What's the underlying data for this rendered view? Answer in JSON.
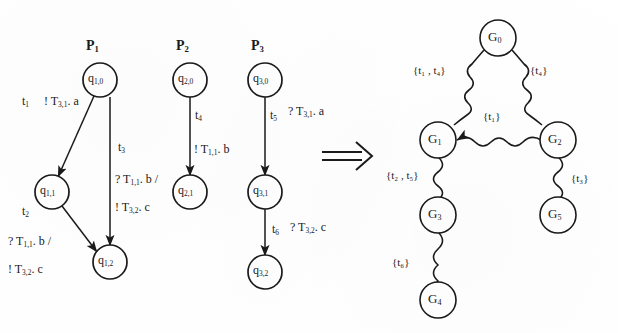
{
  "figure": {
    "implication_symbol": "⟹",
    "left_caption": "",
    "right_caption": ""
  },
  "processes": [
    {
      "name_base": "P",
      "name_sub": "1",
      "cx": 100,
      "states": [
        {
          "id": "p1q0",
          "base": "q",
          "sub": "1,0",
          "cx": 100,
          "cy": 80
        },
        {
          "id": "p1q1",
          "base": "q",
          "sub": "1,1",
          "cx": 52,
          "cy": 192
        },
        {
          "id": "p1q2",
          "base": "q",
          "sub": "1,2",
          "cx": 110,
          "cy": 262
        }
      ],
      "edges": [
        {
          "from": "p1q0",
          "to": "p1q1"
        },
        {
          "from": "p1q0",
          "to": "p1q2"
        },
        {
          "from": "p1q1",
          "to": "p1q2"
        }
      ]
    },
    {
      "name_base": "P",
      "name_sub": "2",
      "cx": 190,
      "states": [
        {
          "id": "p2q0",
          "base": "q",
          "sub": "2,0",
          "cx": 190,
          "cy": 80
        },
        {
          "id": "p2q1",
          "base": "q",
          "sub": "2,1",
          "cx": 190,
          "cy": 192
        }
      ],
      "edges": [
        {
          "from": "p2q0",
          "to": "p2q1"
        }
      ]
    },
    {
      "name_base": "P",
      "name_sub": "3",
      "cx": 265,
      "states": [
        {
          "id": "p3q0",
          "base": "q",
          "sub": "3,0",
          "cx": 265,
          "cy": 80
        },
        {
          "id": "p3q1",
          "base": "q",
          "sub": "3,1",
          "cx": 265,
          "cy": 192
        },
        {
          "id": "p3q2",
          "base": "q",
          "sub": "3,2",
          "cx": 265,
          "cy": 272
        }
      ],
      "edges": [
        {
          "from": "p3q0",
          "to": "p3q1"
        },
        {
          "from": "p3q1",
          "to": "p3q2"
        }
      ]
    }
  ],
  "transition_labels": {
    "t1_name": "t",
    "t1_sub": "1",
    "t1_action": "! T",
    "t1_action_sub": "3,1",
    "t1_action_tail": ". a",
    "t2_name": "t",
    "t2_sub": "2",
    "t2_action_line1": "? T",
    "t2_action_line1_sub": "1,1",
    "t2_action_line1_tail": ". b /",
    "t2_action_line2": "! T",
    "t2_action_line2_sub": "3,2",
    "t2_action_line2_tail": ". c",
    "t3_name": "t",
    "t3_sub": "3",
    "t3_action_line1": "? T",
    "t3_action_line1_sub": "1,1",
    "t3_action_line1_tail": ". b /",
    "t3_action_line2": "! T",
    "t3_action_line2_sub": "3,2",
    "t3_action_line2_tail": ". c",
    "t4_name": "t",
    "t4_sub": "4",
    "t4_action": "! T",
    "t4_action_sub": "1,1",
    "t4_action_tail": ". b",
    "t5_name": "t",
    "t5_sub": "5",
    "t5_action": "? T",
    "t5_action_sub": "3,1",
    "t5_action_tail": ". a",
    "t6_name": "t",
    "t6_sub": "6",
    "t6_action": "? T",
    "t6_action_sub": "3,2",
    "t6_action_tail": ". c"
  },
  "graph": {
    "nodes": [
      {
        "id": "G0",
        "base": "G",
        "sub": "0",
        "cx": 498,
        "cy": 38
      },
      {
        "id": "G1",
        "base": "G",
        "sub": "1",
        "cx": 438,
        "cy": 140
      },
      {
        "id": "G2",
        "base": "G",
        "sub": "2",
        "cx": 558,
        "cy": 140
      },
      {
        "id": "G3",
        "base": "G",
        "sub": "3",
        "cx": 438,
        "cy": 215
      },
      {
        "id": "G4",
        "base": "G",
        "sub": "4",
        "cx": 438,
        "cy": 300
      },
      {
        "id": "G5",
        "base": "G",
        "sub": "5",
        "cx": 558,
        "cy": 215
      }
    ],
    "edges": [
      {
        "id": "e_g0_g1",
        "from": "G0",
        "to": "G1",
        "label_open": "{",
        "label_items": "t₁ , t₄",
        "label_close": "}",
        "lx": 417,
        "ly": 70
      },
      {
        "id": "e_g0_g2",
        "from": "G0",
        "to": "G2",
        "label_open": "{",
        "label_items": "t₄",
        "label_close": "}",
        "lx": 531,
        "ly": 70
      },
      {
        "id": "e_g2_g1",
        "from": "G2",
        "to": "G1",
        "label_open": "{",
        "label_items": "t₁",
        "label_close": "}",
        "lx": 485,
        "ly": 116
      },
      {
        "id": "e_g1_g3",
        "from": "G1",
        "to": "G3",
        "label_open": "{",
        "label_items": "t₂ , t₅",
        "label_close": "}",
        "lx": 390,
        "ly": 175
      },
      {
        "id": "e_g3_g4",
        "from": "G3",
        "to": "G4",
        "label_open": "{",
        "label_items": "t₆",
        "label_close": "}",
        "lx": 395,
        "ly": 262
      },
      {
        "id": "e_g2_g5",
        "from": "G2",
        "to": "G5",
        "label_open": "{",
        "label_items": "t₃",
        "label_close": "}",
        "lx": 572,
        "ly": 178
      }
    ]
  }
}
